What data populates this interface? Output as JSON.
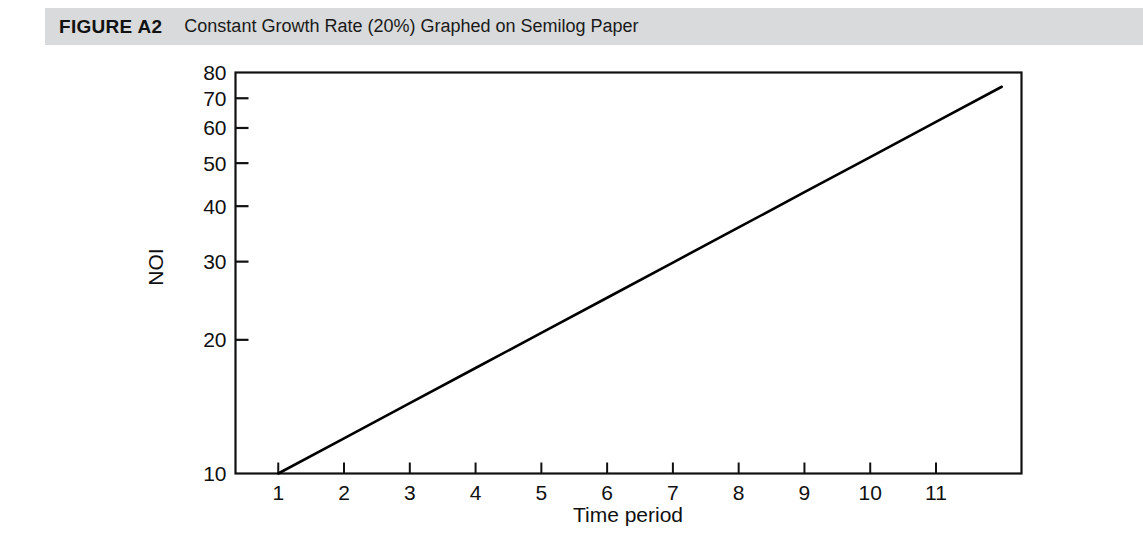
{
  "header": {
    "figure_label": "FIGURE A2",
    "caption": "Constant Growth Rate (20%) Graphed on Semilog Paper",
    "band_color": "#d9dadb"
  },
  "chart_data": {
    "type": "line",
    "title": "Constant Growth Rate (20%) Graphed on Semilog Paper",
    "xlabel": "Time period",
    "ylabel": "NOI",
    "yscale": "log",
    "xscale": "linear",
    "grid": false,
    "legend": null,
    "xlim": [
      0.35,
      12.3
    ],
    "ylim": [
      10,
      80
    ],
    "xticks": [
      1,
      2,
      3,
      4,
      5,
      6,
      7,
      8,
      9,
      10,
      11
    ],
    "xticklabels": [
      "1",
      "2",
      "3",
      "4",
      "5",
      "6",
      "7",
      "8",
      "9",
      "10",
      "11"
    ],
    "yticks": [
      10,
      20,
      30,
      40,
      50,
      60,
      70,
      80
    ],
    "yticklabels": [
      "10",
      "20",
      "30",
      "40",
      "50",
      "60",
      "70",
      "80"
    ],
    "growth_rate_percent": 20,
    "series": [
      {
        "name": "NOI",
        "color": "#000000",
        "x": [
          1,
          2,
          3,
          4,
          5,
          6,
          7,
          8,
          9,
          10,
          11,
          12
        ],
        "values": [
          10,
          12,
          14.4,
          17.28,
          20.74,
          24.88,
          29.86,
          35.83,
          43,
          51.6,
          61.92,
          74.3
        ]
      }
    ],
    "annotations": []
  }
}
